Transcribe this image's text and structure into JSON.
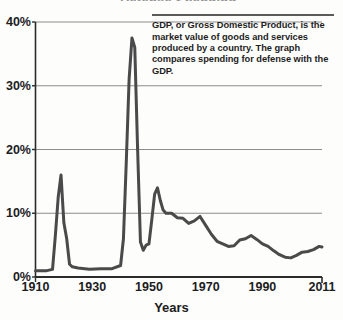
{
  "title_remnant": "Defense Spending",
  "annotation": {
    "text": "GDP, or Gross Domestic Product, is the market value of goods and services produced by a country. The graph compares spending for defense with the GDP."
  },
  "axis": {
    "xlabel": "Years",
    "ylabel": "",
    "yticks": [
      "0%",
      "10%",
      "20%",
      "30%",
      "40%"
    ],
    "xticks": [
      "1910",
      "1930",
      "1950",
      "1970",
      "1990",
      "2011"
    ]
  },
  "colors": {
    "line": "#4a4a4a",
    "grid": "#8c8c8c",
    "axis": "#2b2b2b",
    "text": "#1c1c1c",
    "background": "#fdfdfc"
  },
  "chart_data": {
    "type": "line",
    "title": "Defense Spending",
    "xlabel": "Years",
    "ylabel": "Percent of GDP",
    "xlim": [
      1910,
      2011
    ],
    "ylim": [
      0,
      40
    ],
    "yticks": [
      0,
      10,
      20,
      30,
      40
    ],
    "xticks": [
      1910,
      1930,
      1950,
      1970,
      1990,
      2011
    ],
    "ytick_labels": [
      "0%",
      "10%",
      "20%",
      "30%",
      "40%"
    ],
    "grid": "horizontal",
    "legend": "none",
    "units": "percent of GDP",
    "series": [
      {
        "name": "Defense spending as percent of GDP",
        "x": [
          1910,
          1914,
          1916,
          1917,
          1918,
          1919,
          1920,
          1921,
          1922,
          1923,
          1925,
          1929,
          1933,
          1937,
          1940,
          1941,
          1942,
          1943,
          1944,
          1945,
          1946,
          1947,
          1948,
          1949,
          1950,
          1951,
          1952,
          1953,
          1954,
          1955,
          1956,
          1958,
          1960,
          1962,
          1964,
          1966,
          1968,
          1970,
          1972,
          1974,
          1976,
          1978,
          1980,
          1982,
          1984,
          1986,
          1988,
          1990,
          1992,
          1994,
          1996,
          1998,
          2000,
          2002,
          2004,
          2006,
          2008,
          2010,
          2011
        ],
        "values": [
          1.0,
          1.0,
          1.2,
          6.5,
          12.5,
          16.0,
          8.5,
          6.0,
          2.0,
          1.6,
          1.4,
          1.2,
          1.3,
          1.3,
          1.8,
          6.0,
          18.0,
          31.0,
          37.5,
          36.0,
          20.0,
          5.5,
          4.2,
          5.0,
          5.2,
          9.0,
          13.0,
          14.0,
          12.0,
          10.5,
          10.0,
          10.0,
          9.3,
          9.2,
          8.4,
          8.8,
          9.5,
          8.1,
          6.7,
          5.6,
          5.2,
          4.8,
          4.9,
          5.8,
          6.0,
          6.5,
          5.9,
          5.2,
          4.8,
          4.1,
          3.5,
          3.1,
          3.0,
          3.4,
          3.9,
          4.0,
          4.3,
          4.8,
          4.7
        ]
      }
    ]
  }
}
